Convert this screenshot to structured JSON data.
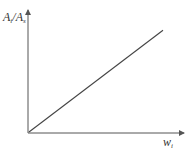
{
  "chart_data": {
    "type": "line",
    "title": "",
    "xlabel": "w_i",
    "ylabel": "A_i/A_s",
    "series": [
      {
        "name": "A_i/A_s vs w_i",
        "x": [
          0,
          1
        ],
        "y": [
          0,
          0.85
        ]
      }
    ],
    "xlim": [
      0,
      1
    ],
    "ylim": [
      0,
      1
    ],
    "grid": false,
    "legend": "none",
    "tick_labels": false
  },
  "labels": {
    "y_main": "A",
    "y_sub1": "i",
    "y_sep": "/A",
    "y_sub2": "s",
    "x_main": "w",
    "x_sub": "i"
  },
  "colors": {
    "axis": "#555555",
    "line": "#444444"
  }
}
